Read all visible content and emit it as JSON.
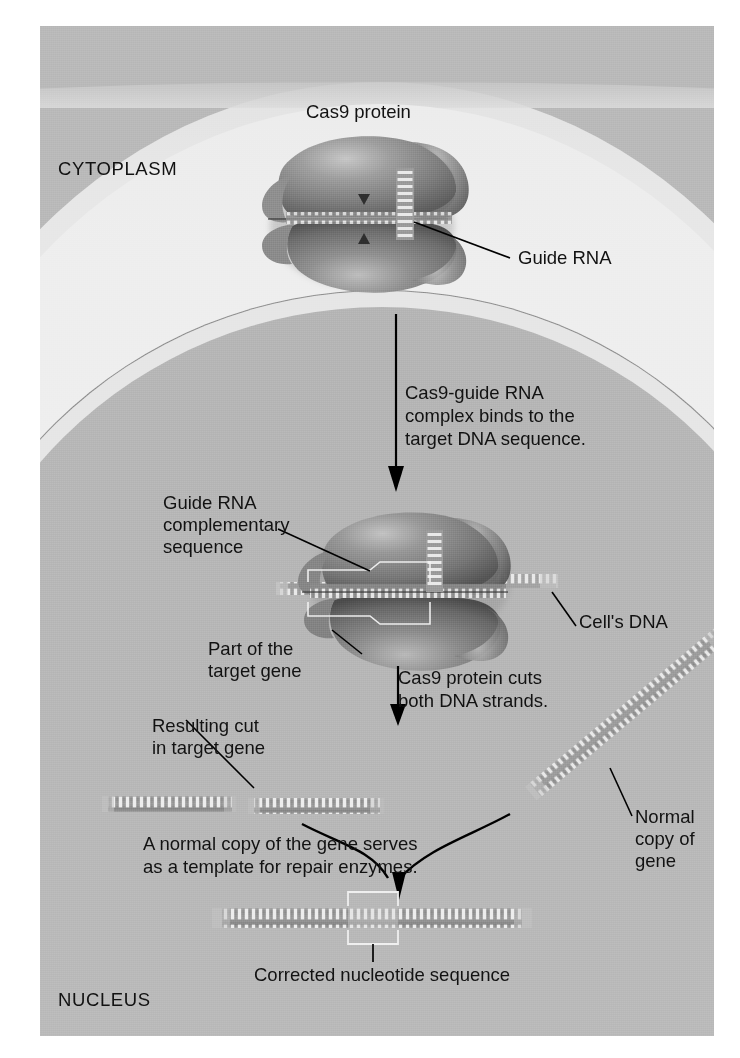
{
  "figure": {
    "title_alt": "CRISPR-Cas9 gene editing diagram",
    "compartments": {
      "cytoplasm_label": "CYTOPLASM",
      "nucleus_label": "NUCLEUS"
    },
    "labels": {
      "cas9_protein": "Cas9 protein",
      "guide_rna": "Guide RNA",
      "guide_rna_complementary": "Guide RNA\ncomplementary\nsequence",
      "cells_dna": "Cell's DNA",
      "part_of_target_gene": "Part of the\ntarget gene",
      "resulting_cut": "Resulting cut\nin target gene",
      "normal_copy": "Normal\ncopy of\ngene",
      "corrected_sequence": "Corrected nucleotide sequence"
    },
    "steps": [
      {
        "id": "step-1",
        "text": "Cas9-guide RNA\ncomplex binds to the\ntarget DNA sequence."
      },
      {
        "id": "step-2",
        "text": "Cas9 protein cuts\nboth DNA strands."
      },
      {
        "id": "step-3",
        "text": "A normal copy of the gene serves\nas a template for repair enzymes."
      }
    ],
    "colors": {
      "page_background": "#ffffff",
      "outer_frame": "#b9b9b9",
      "cytoplasm": "#ececec",
      "cell_membrane": "#c6c6c6",
      "nuclear_envelope": "#e6e6e6",
      "nucleoplasm": "#b8b8b8",
      "protein_fill": "#7e7e7e",
      "protein_highlight": "#b5b5b5",
      "protein_shadow": "#4f4f4f",
      "dna_backbone": "#8e8e8e",
      "dna_rung": "#efefef",
      "text": "#111111",
      "leader_line": "#000000"
    },
    "dna_elements": [
      {
        "id": "cut-fragment-left",
        "rungs": 13,
        "orientation": "horizontal"
      },
      {
        "id": "cut-fragment-right",
        "rungs": 13,
        "orientation": "horizontal"
      },
      {
        "id": "normal-copy-strand",
        "rungs": 30,
        "orientation": "diagonal"
      },
      {
        "id": "repaired-strand",
        "rungs": 31,
        "orientation": "horizontal"
      }
    ]
  }
}
